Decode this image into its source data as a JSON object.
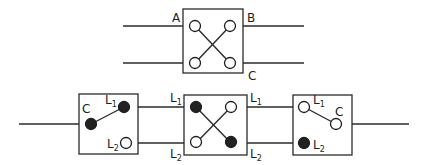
{
  "diagram": {
    "title": "",
    "colors": {
      "line": "#2b2b2b",
      "filled_terminal": "#222222",
      "open_terminal": "#ffffff"
    },
    "top_switch": {
      "type": "intermediate (crossover) switch",
      "labels": {
        "a": "A",
        "b": "B",
        "c": "C"
      },
      "terminals": [
        "open",
        "open",
        "open",
        "open"
      ]
    },
    "bottom_circuit": {
      "left_switch": {
        "type": "two-way switch",
        "labels": {
          "common": "C",
          "l1": "L",
          "l1_sub": "1",
          "l2": "L",
          "l2_sub": "2"
        },
        "terminals": {
          "common": "filled",
          "l1": "filled",
          "l2": "open"
        },
        "position": "C connected to L1"
      },
      "middle_switch": {
        "type": "intermediate (crossover) switch",
        "labels": {
          "left_l1": "L",
          "left_l1_sub": "1",
          "left_l2": "L",
          "left_l2_sub": "2",
          "right_l1": "L",
          "right_l1_sub": "1",
          "right_l2": "L",
          "right_l2_sub": "2"
        },
        "terminals": {
          "top_left": "filled",
          "top_right": "open",
          "bottom_left": "open",
          "bottom_right": "filled"
        }
      },
      "right_switch": {
        "type": "two-way switch",
        "labels": {
          "common": "C",
          "l1": "L",
          "l1_sub": "1",
          "l2": "L",
          "l2_sub": "2"
        },
        "terminals": {
          "common": "open",
          "l1": "open",
          "l2": "filled"
        },
        "position": "C connected to L1"
      }
    }
  }
}
